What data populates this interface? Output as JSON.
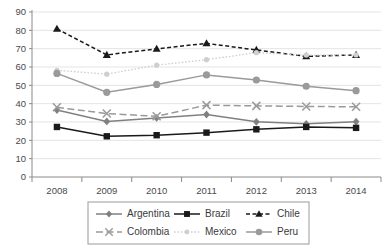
{
  "chart_data": {
    "type": "line",
    "title": "",
    "xlabel": "",
    "ylabel": "",
    "x": [
      "2008",
      "2009",
      "2010",
      "2011",
      "2012",
      "2013",
      "2014"
    ],
    "categories": [
      "2008",
      "2009",
      "2010",
      "2011",
      "2012",
      "2013",
      "2014"
    ],
    "ylim": [
      0,
      90
    ],
    "ytick_step": 10,
    "yticks": [
      "0",
      "10",
      "20",
      "30",
      "40",
      "50",
      "60",
      "70",
      "80",
      "90"
    ],
    "grid": true,
    "legend_position": "bottom",
    "series": [
      {
        "name": "Argentina",
        "values": [
          36.5,
          30.3,
          32.2,
          34.1,
          30.1,
          29.0,
          30.2
        ],
        "color": "#808080",
        "marker": "diamond",
        "dash": "none"
      },
      {
        "name": "Brazil",
        "values": [
          27.3,
          22.2,
          22.8,
          24.2,
          26.0,
          27.3,
          26.8
        ],
        "color": "#1a1a1a",
        "marker": "square",
        "dash": "none"
      },
      {
        "name": "Chile",
        "values": [
          80.8,
          66.6,
          69.9,
          72.9,
          69.3,
          65.8,
          66.6
        ],
        "color": "#1a1a1a",
        "marker": "triangle",
        "dash": "dash"
      },
      {
        "name": "Colombia",
        "values": [
          38.0,
          34.6,
          33.1,
          39.2,
          38.8,
          38.5,
          38.3
        ],
        "color": "#9a9a9a",
        "marker": "cross",
        "dash": "longdash"
      },
      {
        "name": "Mexico",
        "values": [
          58.2,
          56.1,
          61.0,
          64.0,
          67.8,
          66.5,
          66.6
        ],
        "color": "#cfcfcf",
        "marker": "dot",
        "dash": "dot"
      },
      {
        "name": "Peru",
        "values": [
          56.5,
          46.2,
          50.5,
          55.7,
          52.9,
          49.5,
          47.1
        ],
        "color": "#9a9a9a",
        "marker": "circle",
        "dash": "none"
      }
    ]
  },
  "legend": {
    "items": [
      "Argentina",
      "Brazil",
      "Chile",
      "Colombia",
      "Mexico",
      "Peru"
    ]
  },
  "colors": {
    "grid": "#d8d8d8",
    "axis": "#8a8a8a",
    "text": "#4a4a4a",
    "background": "#ffffff"
  }
}
